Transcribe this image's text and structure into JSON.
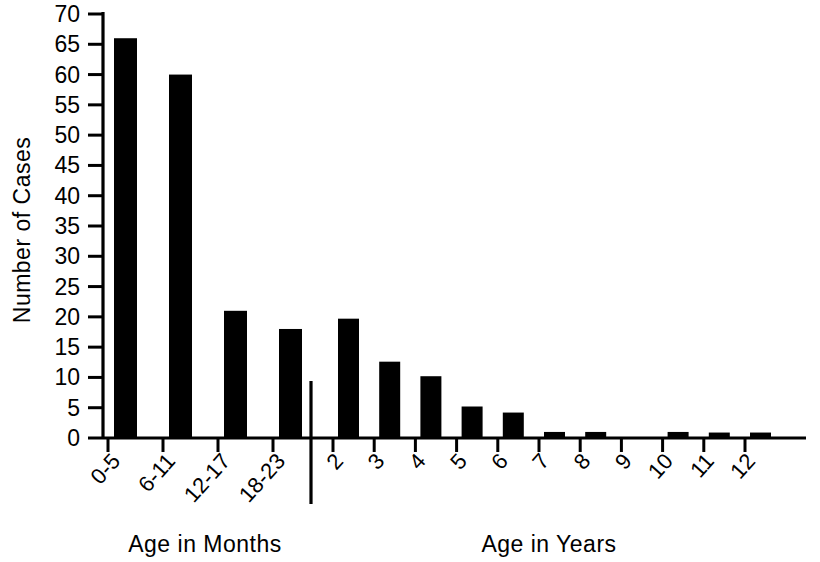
{
  "chart_data": {
    "type": "bar",
    "title": "",
    "subtitle": "",
    "ylabel": "Number of Cases",
    "xlabel": "",
    "ylim": [
      0,
      70
    ],
    "ytick_step": 5,
    "yticks": [
      0,
      5,
      10,
      15,
      20,
      25,
      30,
      35,
      40,
      45,
      50,
      55,
      60,
      65,
      70
    ],
    "ytick_labels": [
      "0",
      "5",
      "10",
      "15",
      "20",
      "25",
      "30",
      "35",
      "40",
      "45",
      "50",
      "55",
      "60",
      "65",
      "70"
    ],
    "grid": false,
    "legend": null,
    "bar_color": "#000000",
    "groups": [
      {
        "name": "Age in Months",
        "axis_title": "Age in Months",
        "categories": [
          "0-5",
          "6-11",
          "12-17",
          "18-23"
        ],
        "values": [
          66,
          60,
          21,
          18
        ]
      },
      {
        "name": "Age in Years",
        "axis_title": "Age in Years",
        "categories": [
          "2",
          "3",
          "4",
          "5",
          "6",
          "7",
          "8",
          "9",
          "10",
          "11",
          "12"
        ],
        "values": [
          19.7,
          12.6,
          10.2,
          5.2,
          4.2,
          1,
          1,
          0,
          1,
          0.9,
          0.9
        ]
      }
    ],
    "categories": [
      "0-5",
      "6-11",
      "12-17",
      "18-23",
      "2",
      "3",
      "4",
      "5",
      "6",
      "7",
      "8",
      "9",
      "10",
      "11",
      "12"
    ],
    "values": [
      66,
      60,
      21,
      18,
      19.7,
      12.6,
      10.2,
      5.2,
      4.2,
      1,
      1,
      0,
      1,
      0.9,
      0.9
    ],
    "annotations": [
      {
        "type": "group-separator",
        "description": "vertical divider between months and years sections"
      }
    ]
  },
  "axis_titles": {
    "y": "Number of Cases",
    "x_left": "Age in Months",
    "x_right": "Age in Years"
  }
}
